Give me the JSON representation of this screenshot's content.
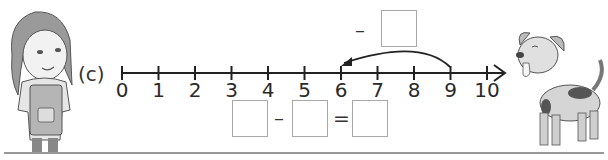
{
  "exercise": {
    "part_label": "(c)",
    "number_line": {
      "min": 0,
      "max": 10,
      "ticks": [
        "0",
        "1",
        "2",
        "3",
        "4",
        "5",
        "6",
        "7",
        "8",
        "9",
        "10"
      ],
      "jump": {
        "from": 9,
        "to": 6,
        "direction": "backward"
      }
    },
    "jump_label": {
      "operator": "–",
      "box_value": ""
    },
    "equation": {
      "first_box": "",
      "minus": "–",
      "second_box": "",
      "equals": "=",
      "result_box": ""
    }
  },
  "illustrations": {
    "left": "girl-in-apron",
    "right": "spotted-dog"
  }
}
